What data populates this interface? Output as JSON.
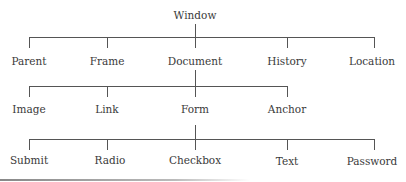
{
  "diagram": {
    "type": "tree",
    "root": "Window",
    "level1": [
      "Parent",
      "Frame",
      "Document",
      "History",
      "Location"
    ],
    "level2_parent": "Document",
    "level2": [
      "Image",
      "Link",
      "Form",
      "Anchor"
    ],
    "level3_parent": "Form",
    "level3": [
      "Submit",
      "Radio",
      "Checkbox",
      "Text",
      "Password"
    ]
  }
}
